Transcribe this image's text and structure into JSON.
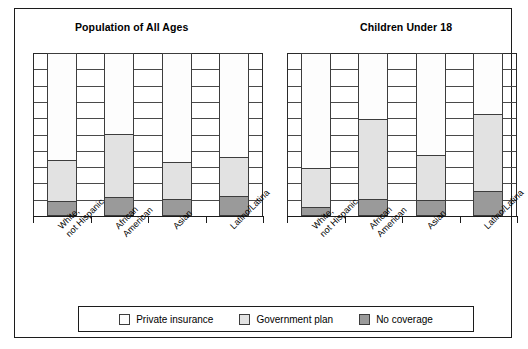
{
  "figure": {
    "legend": {
      "entries": [
        {
          "label": "Private insurance",
          "key": "private",
          "color": "#fdfdfd"
        },
        {
          "label": "Government plan",
          "key": "gov",
          "color": "#e2e2e2"
        },
        {
          "label": "No coverage",
          "key": "none",
          "color": "#9a9a9a"
        }
      ]
    }
  },
  "chart_data": {
    "type": "bar",
    "subtype": "stacked-100-percent",
    "title": "",
    "panels": [
      {
        "title": "Population of All Ages",
        "categories": [
          "White, not Hispanic",
          "African American",
          "Asian",
          "Latino/Latina"
        ],
        "category_lines": [
          [
            "White,",
            "not Hispanic"
          ],
          [
            "African",
            "American"
          ],
          [
            "Asian"
          ],
          [
            "Latino/Latina"
          ]
        ],
        "series": [
          {
            "name": "Private insurance",
            "values": [
              66,
              53,
              67,
              64
            ]
          },
          {
            "name": "Government plan",
            "values": [
              25,
              42,
              23,
              24
            ]
          },
          {
            "name": "No coverage",
            "values": [
              9,
              12,
              10,
              12
            ]
          }
        ]
      },
      {
        "title": "Children Under 18",
        "categories": [
          "White, not Hispanic",
          "African American",
          "Asian",
          "Latino/Latina"
        ],
        "category_lines": [
          [
            "White,",
            "not Hispanic"
          ],
          [
            "African",
            "American"
          ],
          [
            "Asian"
          ],
          [
            "Latino/Latina"
          ]
        ],
        "series": [
          {
            "name": "Private insurance",
            "values": [
              71,
              40,
              62,
              37
            ]
          },
          {
            "name": "Government plan",
            "values": [
              24,
              49,
              28,
              48
            ]
          },
          {
            "name": "No coverage",
            "values": [
              5,
              10,
              9,
              15
            ]
          }
        ]
      }
    ],
    "ylim": [
      0,
      100
    ],
    "y_gridline_step": 10,
    "y_tick_labels": [],
    "xlabel": "",
    "ylabel": "",
    "grid": true,
    "legend_position": "bottom-center"
  }
}
